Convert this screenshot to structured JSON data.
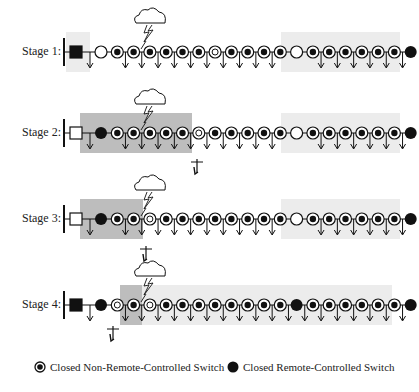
{
  "stages": [
    {
      "label": "Stage 1:",
      "y": 52,
      "source": {
        "type": "square-filled"
      },
      "regions": [
        {
          "x1": 66,
          "x2": 90,
          "tone": "light"
        },
        {
          "x1": 281,
          "x2": 400,
          "tone": "light"
        }
      ],
      "nodes": [
        "open",
        "dot",
        "dot",
        "dot",
        "dot",
        "dot",
        "dot",
        "ring",
        "dot",
        "dot",
        "dot",
        "dot",
        "open",
        "dot",
        "dot",
        "dot",
        "dot",
        "dot",
        "dot",
        "filled"
      ],
      "fault_x": 150,
      "crew": null
    },
    {
      "label": "Stage 2:",
      "y": 133,
      "source": {
        "type": "square-open"
      },
      "regions": [
        {
          "x1": 80,
          "x2": 192,
          "tone": "dark"
        },
        {
          "x1": 281,
          "x2": 400,
          "tone": "light"
        }
      ],
      "nodes": [
        "filled",
        "dot",
        "dot",
        "dot",
        "dot",
        "dot",
        "ring",
        "dot",
        "dot",
        "dot",
        "dot",
        "dot",
        "open",
        "dot",
        "dot",
        "dot",
        "dot",
        "dot",
        "dot",
        "filled"
      ],
      "fault_x": 150,
      "crew": {
        "x": 197,
        "y": 168
      }
    },
    {
      "label": "Stage 3:",
      "y": 219,
      "source": {
        "type": "square-open"
      },
      "regions": [
        {
          "x1": 80,
          "x2": 143,
          "tone": "dark"
        },
        {
          "x1": 281,
          "x2": 400,
          "tone": "light"
        }
      ],
      "nodes": [
        "filled",
        "dot",
        "dot",
        "ring",
        "dot",
        "dot",
        "dot",
        "dot",
        "dot",
        "dot",
        "dot",
        "dot",
        "open",
        "dot",
        "dot",
        "dot",
        "dot",
        "dot",
        "dot",
        "filled"
      ],
      "fault_x": 150,
      "crew": {
        "x": 146,
        "y": 255
      }
    },
    {
      "label": "Stage 4:",
      "y": 305,
      "source": {
        "type": "square-filled"
      },
      "regions": [
        {
          "x1": 120,
          "x2": 142,
          "tone": "dark"
        },
        {
          "x1": 142,
          "x2": 392,
          "tone": "light"
        }
      ],
      "nodes": [
        "filled",
        "ring",
        "dot",
        "ring",
        "dot",
        "dot",
        "dot",
        "dot",
        "dot",
        "dot",
        "dot",
        "dot",
        "filled",
        "dot",
        "dot",
        "dot",
        "dot",
        "dot",
        "dot",
        "filled"
      ],
      "fault_x": 150,
      "crew": {
        "x": 113,
        "y": 335
      }
    }
  ],
  "legend": {
    "non_remote": "Closed Non-Remote-Controlled Switch",
    "remote": "Closed Remote-Controlled Switch"
  },
  "colors": {
    "dark_region": "#bdbdbd",
    "light_region": "#ececec",
    "ink": "#111111"
  }
}
